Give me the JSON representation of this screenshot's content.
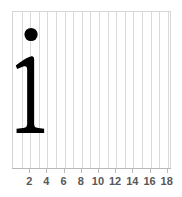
{
  "chart_data": {
    "type": "scatter",
    "title": "",
    "subtitle": "",
    "xlabel": "",
    "ylabel": "",
    "xlim": [
      0,
      18.5
    ],
    "ylim": [
      0,
      1
    ],
    "grid": "vertical-only",
    "legend": "none",
    "background_color": "#ffffff",
    "gridline_color": "#d9d9d9",
    "border_color": "#d6d6d6",
    "axis_color": "#b9b9b9",
    "mark_color": "#000000",
    "tick_label_color": "#585858",
    "x_ticks": [
      2,
      4,
      6,
      8,
      10,
      12,
      14,
      16,
      18
    ],
    "x_tick_labels": [
      "2",
      "4",
      "6",
      "8",
      "10",
      "12",
      "14",
      "16",
      "18"
    ],
    "x_gridlines": [
      1,
      2,
      3,
      4,
      5,
      6,
      7,
      8,
      9,
      10,
      11,
      12,
      13,
      14,
      15,
      16,
      17,
      18
    ],
    "y_ticks": [],
    "y_tick_labels": [],
    "annotation": {
      "name": "letter-i-glyph",
      "text": "i",
      "typeface_style": "serif",
      "color": "#000000",
      "dot": {
        "x": 2.1,
        "y_top_px": 27,
        "diameter_px": 13
      },
      "stem": {
        "x": 2.1,
        "top_px": 58,
        "bottom_px": 130
      }
    }
  },
  "axis": {
    "tick_font_size_px": 11,
    "tick_font_weight": "bold"
  }
}
